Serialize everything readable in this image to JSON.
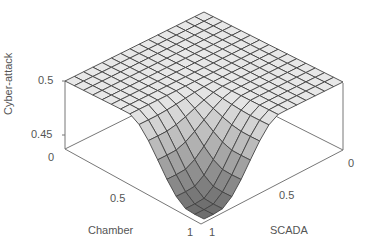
{
  "chart_data": {
    "type": "surface3d",
    "title": "",
    "xlabel": "Chamber",
    "ylabel": "SCADA",
    "zlabel": "Cyber-attack",
    "x_ticks": [
      "0",
      "0.5",
      "1"
    ],
    "y_ticks": [
      "0",
      "0.5",
      "1"
    ],
    "z_ticks": [
      "0.45",
      "0.5"
    ],
    "xlim": [
      0,
      1
    ],
    "ylim": [
      0,
      1
    ],
    "zlim": [
      0.44,
      0.5
    ],
    "grid_size": [
      15,
      15
    ],
    "grid": false,
    "colormap": "gray",
    "sample_points": [
      {
        "chamber": 0,
        "scada": 0,
        "cyber_attack": 0.5
      },
      {
        "chamber": 0,
        "scada": 1,
        "cyber_attack": 0.5
      },
      {
        "chamber": 1,
        "scada": 0,
        "cyber_attack": 0.5
      },
      {
        "chamber": 0.5,
        "scada": 0.5,
        "cyber_attack": 0.5
      },
      {
        "chamber": 0.75,
        "scada": 0.75,
        "cyber_attack": 0.45
      },
      {
        "chamber": 1,
        "scada": 1,
        "cyber_attack": 0.44
      }
    ]
  },
  "labels": {
    "zlabel": "Cyber-attack",
    "xlabel": "Chamber",
    "ylabel": "SCADA",
    "z_tick_top": "0.5",
    "z_tick_bottom": "0.45",
    "x_tick_0": "0",
    "x_tick_05": "0.5",
    "x_tick_1": "1",
    "y_tick_0": "0",
    "y_tick_05": "0.5",
    "y_tick_1": "1"
  }
}
